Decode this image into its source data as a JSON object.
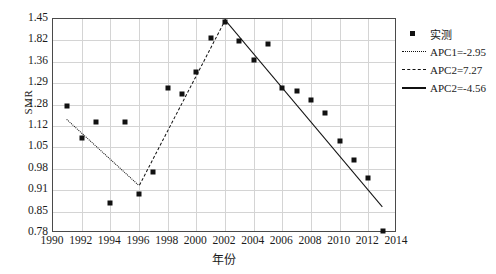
{
  "chart_data": {
    "type": "scatter",
    "title": "",
    "xlabel": "年份",
    "ylabel": "SMR",
    "grid": true,
    "legend_position": "right",
    "xlim": [
      1990,
      2014
    ],
    "xticks": [
      "1990",
      "1992",
      "1994",
      "1996",
      "1998",
      "2000",
      "2002",
      "2004",
      "2006",
      "2008",
      "2010",
      "2012",
      "2014"
    ],
    "yticks": [
      "1.45",
      "1.82",
      "1.36",
      "1.29",
      "1.28",
      "1.12",
      "1.05",
      "0.98",
      "0.91",
      "0.85",
      "0.78"
    ],
    "legend": [
      {
        "label": "实测",
        "style": "marker"
      },
      {
        "label": "APC1=-2.95",
        "style": "dotted"
      },
      {
        "label": "APC2=7.27",
        "style": "dashed"
      },
      {
        "label": "APC2=-4.56",
        "style": "solid"
      }
    ],
    "series": [
      {
        "name": "实测",
        "style": "marker",
        "points": [
          {
            "x": 1991,
            "y": 1.18
          },
          {
            "x": 1992,
            "y": 1.08
          },
          {
            "x": 1993,
            "y": 1.13
          },
          {
            "x": 1994,
            "y": 0.87
          },
          {
            "x": 1995,
            "y": 1.13
          },
          {
            "x": 1996,
            "y": 0.9
          },
          {
            "x": 1997,
            "y": 0.97
          },
          {
            "x": 1998,
            "y": 1.24
          },
          {
            "x": 1999,
            "y": 1.22
          },
          {
            "x": 2000,
            "y": 1.29
          },
          {
            "x": 2001,
            "y": 1.4
          },
          {
            "x": 2002,
            "y": 1.45
          },
          {
            "x": 2003,
            "y": 1.39
          },
          {
            "x": 2004,
            "y": 1.33
          },
          {
            "x": 2005,
            "y": 1.38
          },
          {
            "x": 2006,
            "y": 1.24
          },
          {
            "x": 2007,
            "y": 1.23
          },
          {
            "x": 2008,
            "y": 1.2
          },
          {
            "x": 2009,
            "y": 1.16
          },
          {
            "x": 2010,
            "y": 1.07
          },
          {
            "x": 2011,
            "y": 1.01
          },
          {
            "x": 2012,
            "y": 0.95
          },
          {
            "x": 2013,
            "y": 0.78
          }
        ]
      },
      {
        "name": "APC1=-2.95",
        "style": "dotted",
        "points": [
          {
            "x": 1991,
            "y": 1.14
          },
          {
            "x": 1996,
            "y": 0.93
          }
        ]
      },
      {
        "name": "APC2=7.27",
        "style": "dashed",
        "points": [
          {
            "x": 1996,
            "y": 0.93
          },
          {
            "x": 2002,
            "y": 1.46
          }
        ]
      },
      {
        "name": "APC2=-4.56",
        "style": "solid",
        "points": [
          {
            "x": 2002,
            "y": 1.46
          },
          {
            "x": 2013,
            "y": 0.86
          }
        ]
      }
    ]
  }
}
